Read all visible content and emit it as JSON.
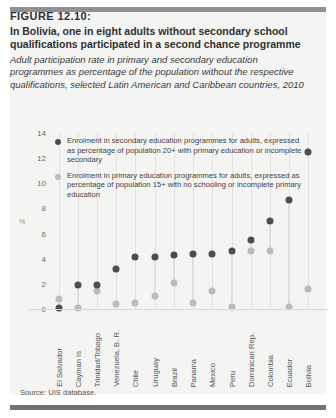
{
  "figure": {
    "number": "FIGURE 12.10:",
    "title": "In Bolivia, one in eight adults without secondary school qualifications participated in a second chance programme",
    "subtitle": "Adult participation rate in primary and secondary education programmes as percentage of the population without the respective qualifications, selected Latin American and Caribbean countries, 2010",
    "source": "Source: UIS database."
  },
  "colors": {
    "dark_series": "#4a4d51",
    "light_series": "#b9bcbe",
    "panel_bg": "#f4f4f2",
    "rule_top": "#8d9094",
    "rule_bottom": "#6f7377",
    "axis_text": "#6c7073"
  },
  "legend": {
    "items": [
      {
        "marker": "dark-circle-icon",
        "color": "#4a4d51",
        "text": "Enrolment in secondary education programmes for adults, expressed as percentage of population 20+ with primary education or incomplete secondary"
      },
      {
        "marker": "light-circle-icon",
        "color": "#b9bcbe",
        "text": "Enrolment in primary education programmes for adults, expressed as percentage of population 15+ with no schooling or incomplete primary education"
      }
    ]
  },
  "chart_data": {
    "type": "scatter",
    "title": "In Bolivia, one in eight adults without secondary school qualifications participated in a second chance programme",
    "subtitle": "Adult participation rate in primary and secondary education programmes as percentage of the population without the respective qualifications, selected Latin American and Caribbean countries, 2010",
    "xlabel": "",
    "ylabel": "%",
    "ylim": [
      0,
      14
    ],
    "yticks": [
      0,
      2,
      4,
      6,
      8,
      10,
      12,
      14
    ],
    "grid": "vertical",
    "legend_position": "top-left-inside",
    "categories": [
      "El Salvador",
      "Cayman Is",
      "Trinidad/Tobago",
      "Venezuela, B. R.",
      "Chile",
      "Uruguay",
      "Brazil",
      "Panama",
      "Mexico",
      "Peru",
      "Dominican Rep.",
      "Colombia",
      "Ecuador",
      "Bolivia"
    ],
    "series": [
      {
        "name": "Enrolment in secondary education programmes for adults, expressed as percentage of population 20+ with primary education or incomplete secondary",
        "color": "#4a4d51",
        "values": [
          0.1,
          1.9,
          1.95,
          3.2,
          4.1,
          4.1,
          4.3,
          4.4,
          4.4,
          4.6,
          5.5,
          7.0,
          8.7,
          12.5
        ]
      },
      {
        "name": "Enrolment in primary education programmes for adults, expressed as percentage of population 15+ with no schooling or incomplete primary education",
        "color": "#b9bcbe",
        "values": [
          0.8,
          0.05,
          1.4,
          0.4,
          0.5,
          1.0,
          2.1,
          0.5,
          1.4,
          0.2,
          4.6,
          4.6,
          0.2,
          1.6
        ]
      }
    ],
    "source": "Source: UIS database."
  }
}
